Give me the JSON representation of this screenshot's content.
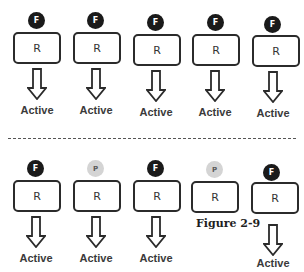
{
  "figure": {
    "caption": "Figure 2-9",
    "colors": {
      "full_agonist": "#1a1a1a",
      "partial_agonist": "#d4d4d4",
      "receptor_border": "#2b2b2b",
      "divider": "#555555"
    }
  },
  "top_row": {
    "cells": [
      {
        "ligand": "F",
        "ligand_type": "full",
        "receptor": "R",
        "output": "Active"
      },
      {
        "ligand": "F",
        "ligand_type": "full",
        "receptor": "R",
        "output": "Active"
      },
      {
        "ligand": "F",
        "ligand_type": "full",
        "receptor": "R",
        "output": "Active"
      },
      {
        "ligand": "F",
        "ligand_type": "full",
        "receptor": "R",
        "output": "Active"
      },
      {
        "ligand": "F",
        "ligand_type": "full",
        "receptor": "R",
        "output": "Active"
      }
    ]
  },
  "bottom_row": {
    "cells": [
      {
        "ligand": "F",
        "ligand_type": "full",
        "receptor": "R",
        "output": "Active"
      },
      {
        "ligand": "P",
        "ligand_type": "partial",
        "receptor": "R",
        "output": "Active"
      },
      {
        "ligand": "F",
        "ligand_type": "full",
        "receptor": "R",
        "output": "Active"
      },
      {
        "ligand": "P",
        "ligand_type": "partial",
        "receptor": "R",
        "output": ""
      },
      {
        "ligand": "F",
        "ligand_type": "full",
        "receptor": "R",
        "output": "Active"
      }
    ]
  }
}
